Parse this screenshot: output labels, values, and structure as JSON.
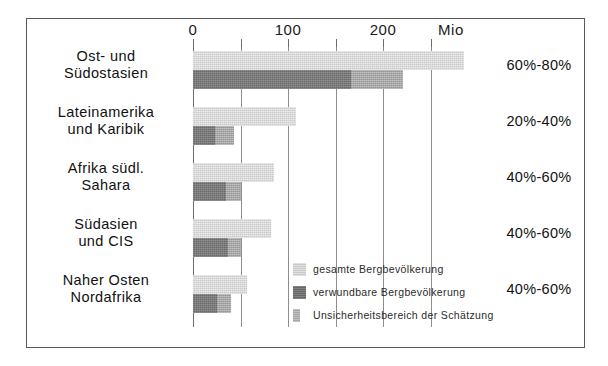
{
  "chart_data": {
    "type": "bar",
    "orientation": "horizontal",
    "title": "",
    "xlabel": "Mio",
    "ylabel": "",
    "xlim": [
      0,
      295
    ],
    "grid": true,
    "gridlines": [
      0,
      50,
      100,
      150,
      200,
      250
    ],
    "tick_labels": [
      "0",
      "100",
      "200"
    ],
    "tick_label_values": [
      0,
      100,
      200
    ],
    "unit_label": "Mio",
    "legend_position": "inside-bottom-right",
    "categories": [
      "Ost- und Südostasien",
      "Lateinamerika und Karibik",
      "Afrika südl. Sahara",
      "Südasien und CIS",
      "Naher Osten Nordafrika"
    ],
    "category_lines": [
      [
        "Ost- und",
        "Südostasien"
      ],
      [
        "Lateinamerika",
        "und Karibik"
      ],
      [
        "Afrika südl.",
        "Sahara"
      ],
      [
        "Südasien",
        "und CIS"
      ],
      [
        "Naher Osten",
        "Nordafrika"
      ]
    ],
    "series": [
      {
        "name": "gesamte Bergbevölkerung",
        "color": "#c9c9c9",
        "values": [
          285,
          108,
          85,
          82,
          57
        ]
      },
      {
        "name": "verwundbare Bergbevölkerung",
        "color": "#686868",
        "values": [
          166,
          23,
          35,
          37,
          25
        ]
      },
      {
        "name": "Unsicherheitsbereich der Schätzung",
        "color": "#a6a6a6",
        "values": [
          221,
          43,
          50,
          50,
          40
        ]
      }
    ],
    "right_labels": [
      "60%-80%",
      "20%-40%",
      "40%-60%",
      "40%-60%",
      "40%-60%"
    ]
  },
  "legend": {
    "items": [
      {
        "label": "gesamte Bergbevölkerung"
      },
      {
        "label": "verwundbare Bergbevölkerung"
      },
      {
        "label": "Unsicherheitsbereich der Schätzung"
      }
    ]
  },
  "colors": {
    "total": "#c9c9c9",
    "vulnerable": "#686868",
    "uncertainty": "#a6a6a6",
    "frame": "#5a5a5a",
    "gridline": "#8e8e8e",
    "text": "#111111"
  }
}
